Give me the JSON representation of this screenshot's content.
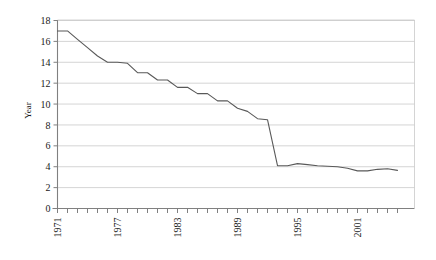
{
  "chart_data": {
    "type": "line",
    "title": "",
    "subtitle": "",
    "xlabel": "",
    "ylabel": "Year",
    "xlim": [
      1971,
      2005
    ],
    "ylim": [
      0,
      18
    ],
    "ytick_step": 2,
    "yticks": [
      "0",
      "2",
      "4",
      "6",
      "8",
      "10",
      "12",
      "14",
      "16",
      "18"
    ],
    "xticks_labeled": [
      "1971",
      "1977",
      "1983",
      "1989",
      "1995",
      "2001"
    ],
    "xtick_interval_years": 1,
    "xtick_label_interval_years": 6,
    "xtick_label_rotation": -90,
    "grid": "horizontal",
    "legend": "none",
    "line_color": "#595959",
    "grid_color": "#c9c9c9",
    "axis_color": "#808080",
    "background_color": "#ffffff",
    "x": [
      1971,
      1972,
      1973,
      1974,
      1975,
      1976,
      1977,
      1978,
      1979,
      1980,
      1981,
      1982,
      1983,
      1984,
      1985,
      1986,
      1987,
      1988,
      1989,
      1990,
      1991,
      1992,
      1993,
      1994,
      1995,
      1996,
      1997,
      1998,
      1999,
      2000,
      2001,
      2002,
      2003,
      2004,
      2005
    ],
    "values": [
      17.0,
      17.0,
      16.2,
      15.4,
      14.6,
      14.0,
      14.0,
      13.9,
      13.0,
      13.0,
      12.3,
      12.3,
      11.6,
      11.6,
      11.0,
      11.0,
      10.3,
      10.3,
      9.6,
      9.3,
      8.6,
      8.5,
      4.1,
      4.1,
      4.3,
      4.2,
      4.1,
      4.05,
      4.0,
      3.85,
      3.6,
      3.6,
      3.75,
      3.8,
      3.65
    ],
    "series_name": ""
  },
  "figure": {
    "y_axis_label": "Year"
  }
}
